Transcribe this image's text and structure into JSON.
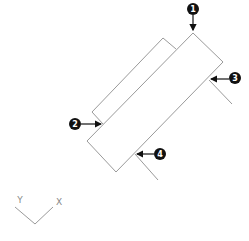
{
  "diagram": {
    "colors": {
      "outline": "#9a9a9a",
      "callout": "#111111",
      "callout_text": "#ffffff"
    },
    "callouts": [
      {
        "label": "1"
      },
      {
        "label": "2"
      },
      {
        "label": "3"
      },
      {
        "label": "4"
      }
    ],
    "axis_icon": {
      "y_label": "Y",
      "x_label": "X"
    }
  }
}
